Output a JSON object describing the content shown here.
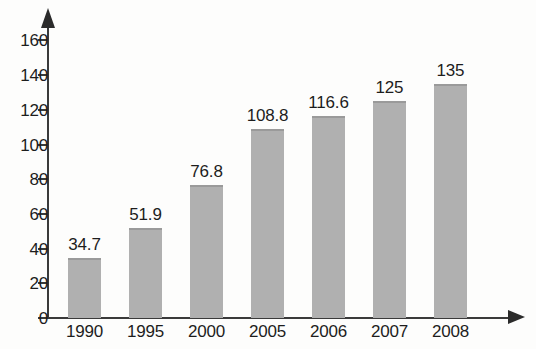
{
  "chart_data": {
    "type": "bar",
    "title": "",
    "subtitle": "",
    "xlabel": "",
    "ylabel": "",
    "categories": [
      "1990",
      "1995",
      "2000",
      "2005",
      "2006",
      "2007",
      "2008"
    ],
    "values": [
      34.7,
      51.9,
      76.8,
      108.8,
      116.6,
      125,
      135
    ],
    "data_labels": [
      "34.7",
      "51.9",
      "76.8",
      "108.8",
      "116.6",
      "125",
      "135"
    ],
    "series": [
      {
        "name": "",
        "values": [
          34.7,
          51.9,
          76.8,
          108.8,
          116.6,
          125,
          135
        ]
      }
    ],
    "ylim": [
      0,
      170
    ],
    "yticks": [
      0,
      20,
      40,
      60,
      80,
      100,
      120,
      140,
      160
    ],
    "ytick_labels": [
      "0",
      "20",
      "40",
      "60",
      "80",
      "100",
      "120",
      "140",
      "160"
    ],
    "grid": false,
    "legend": false,
    "legend_position": "none",
    "axis_arrows": true,
    "bar_color": "#b0b0b0",
    "axis_color": "#3a3a3a",
    "text_color": "#1d1d1d",
    "background_color": "#fdfdfc"
  }
}
